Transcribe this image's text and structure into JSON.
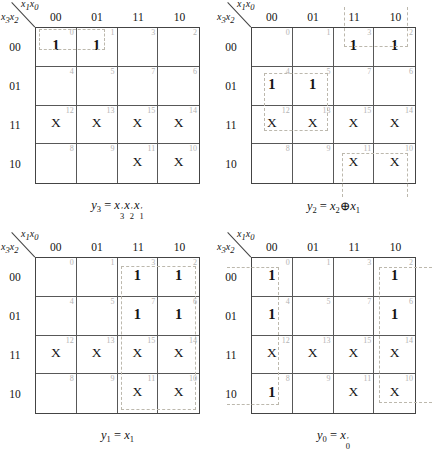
{
  "figure": {
    "colors": {
      "grid_line": "#444444",
      "cell_number": "#b3b3b3",
      "group_dash": "#bcb8ad",
      "text": "#141414",
      "background": "#ffffff"
    }
  },
  "maps": [
    {
      "name": "y3",
      "corner_top": [
        [
          "v",
          "x"
        ],
        [
          "s",
          "1"
        ],
        [
          "v",
          "x"
        ],
        [
          "s",
          "0"
        ]
      ],
      "corner_bottom": [
        [
          "v",
          "x"
        ],
        [
          "s",
          "3"
        ],
        [
          "v",
          "x"
        ],
        [
          "s",
          "2"
        ]
      ],
      "col_labels": [
        "00",
        "01",
        "11",
        "10"
      ],
      "row_labels": [
        "00",
        "01",
        "11",
        "10"
      ],
      "cell_numbers": [
        "0",
        "1",
        "3",
        "2",
        "4",
        "5",
        "7",
        "6",
        "12",
        "13",
        "15",
        "14",
        "8",
        "9",
        "11",
        "10"
      ],
      "cell_values": [
        "1",
        "1",
        "",
        "",
        "",
        "",
        "",
        "",
        "X",
        "X",
        "X",
        "X",
        "",
        "",
        "X",
        "X"
      ],
      "equation": [
        [
          "v",
          "y"
        ],
        [
          "s",
          "3"
        ],
        [
          "o",
          " = "
        ],
        [
          "v",
          "x"
        ],
        [
          "ps",
          "3"
        ],
        [
          "v",
          "x"
        ],
        [
          "ps",
          "2"
        ],
        [
          "v",
          "x"
        ],
        [
          "ps",
          "1"
        ]
      ],
      "groups": [
        {
          "r": 0,
          "c": 0,
          "rs": 1,
          "cs": 2,
          "inset": {
            "t": 2,
            "b": 16,
            "l": 4,
            "r": 13
          }
        }
      ]
    },
    {
      "name": "y2",
      "corner_top": [
        [
          "v",
          "x"
        ],
        [
          "s",
          "1"
        ],
        [
          "v",
          "x"
        ],
        [
          "s",
          "0"
        ]
      ],
      "corner_bottom": [
        [
          "v",
          "x"
        ],
        [
          "s",
          "3"
        ],
        [
          "v",
          "x"
        ],
        [
          "s",
          "2"
        ]
      ],
      "col_labels": [
        "00",
        "01",
        "11",
        "10"
      ],
      "row_labels": [
        "00",
        "01",
        "11",
        "10"
      ],
      "cell_numbers": [
        "0",
        "1",
        "3",
        "2",
        "4",
        "5",
        "7",
        "6",
        "12",
        "13",
        "15",
        "14",
        "8",
        "9",
        "11",
        "10"
      ],
      "cell_values": [
        "",
        "",
        "1",
        "1",
        "1",
        "1",
        "",
        "",
        "X",
        "X",
        "X",
        "X",
        "",
        "",
        "X",
        "X"
      ],
      "equation": [
        [
          "v",
          "y"
        ],
        [
          "s",
          "2"
        ],
        [
          "o",
          " = "
        ],
        [
          "v",
          "x"
        ],
        [
          "s",
          "2"
        ],
        [
          "o",
          "⊕"
        ],
        [
          "v",
          "x"
        ],
        [
          "s",
          "1"
        ]
      ],
      "groups": [
        {
          "r": 0,
          "c": 2,
          "rs": 1,
          "cs": 2,
          "open": "top",
          "extend": 20,
          "inset": {
            "t": 0,
            "b": 19,
            "l": 10,
            "r": 8
          }
        },
        {
          "r": 1,
          "c": 0,
          "rs": 2,
          "cs": 2,
          "inset": {
            "t": 7,
            "b": 14,
            "l": 13,
            "r": 6
          }
        },
        {
          "r": 3,
          "c": 2,
          "rs": 1,
          "cs": 2,
          "open": "bottom",
          "extend": 13,
          "inset": {
            "t": 8,
            "b": 0,
            "l": 8,
            "r": 8
          }
        }
      ]
    },
    {
      "name": "y1",
      "corner_top": [
        [
          "v",
          "x"
        ],
        [
          "s",
          "1"
        ],
        [
          "v",
          "x"
        ],
        [
          "s",
          "0"
        ]
      ],
      "corner_bottom": [
        [
          "v",
          "x"
        ],
        [
          "s",
          "3"
        ],
        [
          "v",
          "x"
        ],
        [
          "s",
          "2"
        ]
      ],
      "col_labels": [
        "00",
        "01",
        "11",
        "10"
      ],
      "row_labels": [
        "00",
        "01",
        "11",
        "10"
      ],
      "cell_numbers": [
        "0",
        "1",
        "3",
        "2",
        "4",
        "5",
        "7",
        "6",
        "12",
        "13",
        "15",
        "14",
        "8",
        "9",
        "11",
        "10"
      ],
      "cell_values": [
        "",
        "",
        "1",
        "1",
        "",
        "",
        "1",
        "1",
        "X",
        "X",
        "X",
        "X",
        "",
        "",
        "X",
        "X"
      ],
      "equation": [
        [
          "v",
          "y"
        ],
        [
          "s",
          "1"
        ],
        [
          "o",
          " = "
        ],
        [
          "v",
          "x"
        ],
        [
          "s",
          "1"
        ]
      ],
      "groups": [
        {
          "r": 0,
          "c": 2,
          "rs": 4,
          "cs": 2,
          "inset": {
            "t": 9,
            "b": 4,
            "l": 3,
            "r": 4
          }
        }
      ]
    },
    {
      "name": "y0",
      "corner_top": [
        [
          "v",
          "x"
        ],
        [
          "s",
          "1"
        ],
        [
          "v",
          "x"
        ],
        [
          "s",
          "0"
        ]
      ],
      "corner_bottom": [
        [
          "v",
          "x"
        ],
        [
          "s",
          "3"
        ],
        [
          "v",
          "x"
        ],
        [
          "s",
          "2"
        ]
      ],
      "col_labels": [
        "00",
        "01",
        "11",
        "10"
      ],
      "row_labels": [
        "00",
        "01",
        "11",
        "10"
      ],
      "cell_numbers": [
        "0",
        "1",
        "3",
        "2",
        "4",
        "5",
        "7",
        "6",
        "12",
        "13",
        "15",
        "14",
        "8",
        "9",
        "11",
        "10"
      ],
      "cell_values": [
        "1",
        "",
        "",
        "1",
        "1",
        "",
        "",
        "1",
        "X",
        "X",
        "X",
        "X",
        "1",
        "",
        "X",
        "X"
      ],
      "equation": [
        [
          "v",
          "y"
        ],
        [
          "s",
          "0"
        ],
        [
          "o",
          " = "
        ],
        [
          "v",
          "x"
        ],
        [
          "ps",
          "0"
        ]
      ],
      "groups": [
        {
          "r": 0,
          "c": 0,
          "rs": 4,
          "cs": 1,
          "open": "left",
          "extend": 24,
          "inset": {
            "t": 10,
            "b": 9,
            "l": 0,
            "r": 13
          }
        },
        {
          "r": 0,
          "c": 3,
          "rs": 4,
          "cs": 1,
          "open": "right",
          "extend": 16,
          "inset": {
            "t": 10,
            "b": 11,
            "l": 4,
            "r": 0
          }
        }
      ]
    }
  ]
}
